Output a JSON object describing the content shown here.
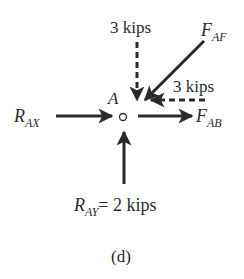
{
  "diagram": {
    "type": "free-body-diagram",
    "joint_label": "A",
    "caption": "(d)",
    "forces": [
      {
        "id": "load_vertical",
        "label": "3 kips",
        "direction": "down",
        "style": "dashed"
      },
      {
        "id": "F_AF",
        "label_main": "F",
        "label_sub": "AF",
        "direction": "down-left",
        "style": "solid"
      },
      {
        "id": "load_horizontal",
        "label": "3 kips",
        "direction": "left",
        "style": "dashed"
      },
      {
        "id": "R_AX",
        "label_main": "R",
        "label_sub": "AX",
        "direction": "right",
        "style": "solid"
      },
      {
        "id": "F_AB",
        "label_main": "F",
        "label_sub": "AB",
        "direction": "right",
        "style": "solid"
      },
      {
        "id": "R_AY",
        "label_main": "R",
        "label_sub": "AY",
        "label_value": "= 2 kips",
        "direction": "up",
        "style": "solid"
      }
    ]
  },
  "colors": {
    "ink": "#2a2a2a",
    "background": "#ffffff"
  }
}
